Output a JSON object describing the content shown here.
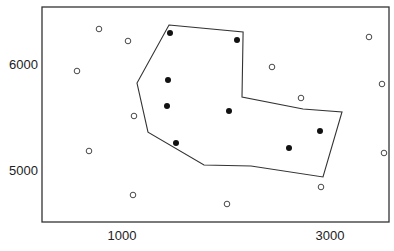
{
  "chart_data": {
    "type": "scatter",
    "title": "",
    "xlabel": "",
    "ylabel": "",
    "x_ticks": [
      1000,
      3000
    ],
    "y_ticks": [
      5000,
      6000
    ],
    "x_tick_labels": [
      "1000",
      "3000"
    ],
    "y_tick_labels": [
      "5000",
      "6000"
    ],
    "xlim": [
      200,
      3540
    ],
    "ylim": [
      4530,
      6540
    ],
    "grid": false,
    "legend": null,
    "series": [
      {
        "name": "inside",
        "marker": "filled-circle",
        "color": "#111111",
        "points": [
          [
            1462,
            6292
          ],
          [
            2106,
            6226
          ],
          [
            1442,
            5849
          ],
          [
            1433,
            5604
          ],
          [
            2029,
            5557
          ],
          [
            1519,
            5255
          ],
          [
            2606,
            5208
          ],
          [
            2904,
            5368
          ]
        ]
      },
      {
        "name": "outside",
        "marker": "open-circle",
        "color": "#333333",
        "points": [
          [
            779,
            6330
          ],
          [
            1058,
            6217
          ],
          [
            567,
            5934
          ],
          [
            1115,
            5509
          ],
          [
            683,
            5179
          ],
          [
            1106,
            4764
          ],
          [
            2010,
            4679
          ],
          [
            2913,
            4840
          ],
          [
            3519,
            5160
          ],
          [
            3500,
            5811
          ],
          [
            2721,
            5679
          ],
          [
            2442,
            5972
          ],
          [
            3375,
            6255
          ]
        ]
      }
    ],
    "polygon": {
      "name": "boundary",
      "color": "#333333",
      "vertices": [
        [
          1452,
          6368
        ],
        [
          2164,
          6302
        ],
        [
          2154,
          5689
        ],
        [
          2740,
          5575
        ],
        [
          3115,
          5547
        ],
        [
          2933,
          4934
        ],
        [
          2240,
          5038
        ],
        [
          1788,
          5047
        ],
        [
          1250,
          5358
        ],
        [
          1144,
          5821
        ]
      ]
    },
    "pixel_map": {
      "frame": {
        "left": 42,
        "top": 7,
        "right": 389,
        "bottom": 222
      },
      "x0_value": 1000,
      "x0_px": 122,
      "x_px_per_unit": 0.104,
      "y0_value": 6000,
      "y0_px": 64,
      "y_px_per_unit": 0.106
    }
  }
}
